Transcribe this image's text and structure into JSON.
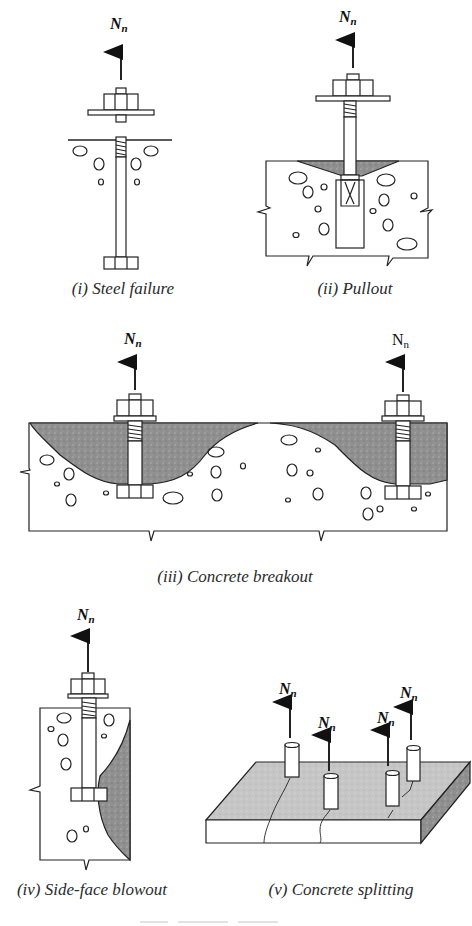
{
  "figure": {
    "load_symbol": "N",
    "load_subscript": "n",
    "colors": {
      "line": "#222222",
      "breakout_fill": "#8f8f8f",
      "concrete": "#ffffff",
      "slab_top": "#c4c4c4",
      "slab_side": "#7a7a7a"
    },
    "panels": [
      {
        "id": "i",
        "caption": "(i) Steel failure",
        "loads": 1
      },
      {
        "id": "ii",
        "caption": "(ii) Pullout",
        "loads": 1
      },
      {
        "id": "iii",
        "caption": "(iii) Concrete breakout",
        "loads": 2
      },
      {
        "id": "iv",
        "caption": "(iv) Side-face blowout",
        "loads": 1
      },
      {
        "id": "v",
        "caption": "(v) Concrete splitting",
        "loads": 4
      }
    ]
  }
}
